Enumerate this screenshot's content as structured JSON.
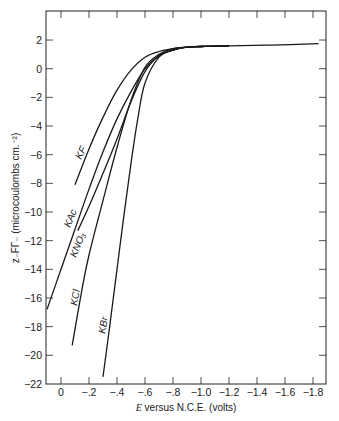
{
  "chart_data": {
    "type": "line",
    "title": "",
    "xlabel": "E versus N.C.E. (volts)",
    "ylabel": "z_FΓ_ (microcoulombs cm.^-2)",
    "xlim": [
      0.1,
      -1.9
    ],
    "ylim": [
      -22,
      4
    ],
    "x_ticks": [
      0,
      -0.2,
      -0.4,
      -0.6,
      -0.8,
      -1.0,
      -1.2,
      -1.4,
      -1.6,
      -1.8
    ],
    "x_tick_labels": [
      "0",
      "−.2",
      "−.4",
      "−.6",
      "−.8",
      "−1.0",
      "−1.2",
      "−1.4",
      "−1.6",
      "−1.8"
    ],
    "y_ticks": [
      2,
      0,
      -2,
      -4,
      -6,
      -8,
      -10,
      -12,
      -14,
      -16,
      -18,
      -20,
      -22
    ],
    "y_tick_labels": [
      "2",
      "0",
      "−2",
      "−4",
      "−6",
      "−8",
      "−10",
      "−12",
      "−14",
      "−16",
      "−18",
      "−20",
      "−22"
    ],
    "grid": false,
    "legend": "inline labels on curves",
    "series": [
      {
        "name": "KF",
        "x": [
          -0.1,
          -0.2,
          -0.3,
          -0.4,
          -0.5,
          -0.6,
          -0.7,
          -0.8,
          -0.9,
          -1.0,
          -1.2,
          -1.5,
          -1.84
        ],
        "y": [
          -8.1,
          -5.6,
          -3.4,
          -1.5,
          -0.1,
          0.8,
          1.2,
          1.4,
          1.5,
          1.55,
          1.6,
          1.65,
          1.75
        ]
      },
      {
        "name": "KAc",
        "x": [
          0.1,
          0.0,
          -0.1,
          -0.2,
          -0.3,
          -0.4,
          -0.5,
          -0.6,
          -0.7,
          -0.8,
          -0.9,
          -1.0,
          -1.2
        ],
        "y": [
          -16.8,
          -14.0,
          -11.2,
          -8.4,
          -5.8,
          -3.5,
          -1.6,
          0.0,
          0.9,
          1.3,
          1.5,
          1.55,
          1.6
        ]
      },
      {
        "name": "KNO3",
        "x": [
          -0.12,
          -0.2,
          -0.3,
          -0.4,
          -0.5,
          -0.6,
          -0.7,
          -0.8,
          -0.9,
          -1.0,
          -1.2
        ],
        "y": [
          -11.3,
          -9.6,
          -7.3,
          -4.9,
          -2.3,
          -0.2,
          0.9,
          1.3,
          1.5,
          1.55,
          1.6
        ]
      },
      {
        "name": "KCl",
        "x": [
          -0.08,
          -0.15,
          -0.2,
          -0.3,
          -0.4,
          -0.5,
          -0.6,
          -0.7,
          -0.8,
          -0.9,
          -1.0,
          -1.2
        ],
        "y": [
          -19.3,
          -15.4,
          -13.0,
          -9.2,
          -5.5,
          -2.2,
          0.1,
          1.0,
          1.4,
          1.5,
          1.55,
          1.6
        ]
      },
      {
        "name": "KBr",
        "x": [
          -0.3,
          -0.35,
          -0.4,
          -0.45,
          -0.5,
          -0.55,
          -0.6,
          -0.7,
          -0.8,
          -0.9,
          -1.0,
          -1.2
        ],
        "y": [
          -21.5,
          -17.8,
          -14.0,
          -10.2,
          -6.6,
          -3.4,
          -1.0,
          0.8,
          1.3,
          1.5,
          1.55,
          1.6
        ]
      }
    ]
  },
  "labels": {
    "xlabel_var": "E",
    "xlabel_rest": " versus N.C.E. (volts)",
    "ylabel": "z₋FΓ₋ (microcoulombs cm.⁻²)",
    "curve_kf": "KF",
    "curve_kac": "KAc",
    "curve_kno3": "KNO₃",
    "curve_kcl": "KCl",
    "curve_kbr": "KBr"
  }
}
